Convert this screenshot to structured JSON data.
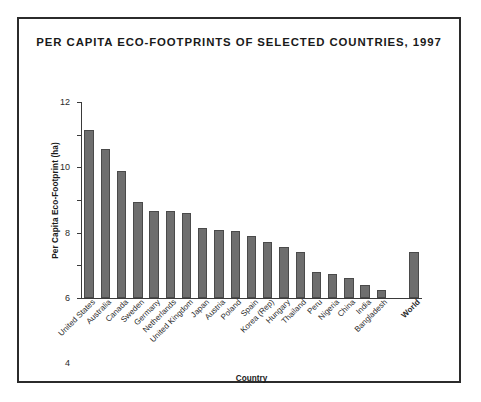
{
  "figure": {
    "title": "PER CAPITA ECO-FOOTPRINTS OF SELECTED COUNTRIES, 1997",
    "border_color": "#2b2b2b",
    "background": "#ffffff"
  },
  "chart_data": {
    "type": "bar",
    "title": "PER CAPITA ECO-FOOTPRINTS OF SELECTED COUNTRIES, 1997",
    "xlabel": "Country",
    "ylabel": "Per Capita Eco-Footprint (ha)",
    "ylim": [
      0,
      12
    ],
    "yticks": [
      0,
      2,
      4,
      6,
      8,
      10,
      12
    ],
    "ytick_labels": [
      "0",
      "2",
      "4",
      "6",
      "8",
      "10",
      "12"
    ],
    "grid": false,
    "legend": false,
    "bar_color": "#6e6e6e",
    "bar_edge_color": "#4a4a4a",
    "categories": [
      "United States",
      "Australia",
      "Canada",
      "Sweden",
      "Germany",
      "Netherlands",
      "United Kingdom",
      "Japan",
      "Austria",
      "Poland",
      "Spain",
      "Korea (Rep)",
      "Hungary",
      "Thailand",
      "Peru",
      "Nigeria",
      "China",
      "India",
      "Bangladesh",
      "World"
    ],
    "values": [
      10.3,
      9.1,
      7.8,
      5.9,
      5.3,
      5.3,
      5.2,
      4.3,
      4.15,
      4.1,
      3.8,
      3.45,
      3.1,
      2.8,
      1.6,
      1.5,
      1.2,
      0.8,
      0.5,
      2.8
    ],
    "bold_categories": [
      "World"
    ],
    "gap_before_last": true
  }
}
